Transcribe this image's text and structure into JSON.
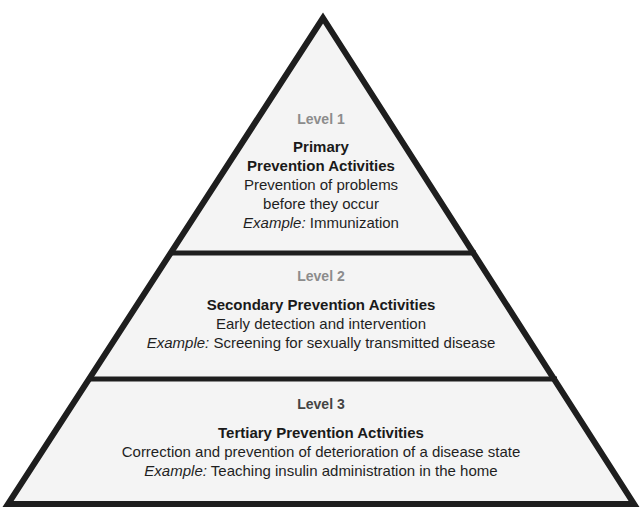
{
  "diagram": {
    "type": "pyramid",
    "colors": {
      "stroke": "#1e1e1e",
      "fill": "#f4f4f4",
      "level_label_light": "#8c8c8c",
      "level_label_dark": "#444444"
    },
    "tiers": [
      {
        "level": "Level 1",
        "title_lines": [
          "Primary",
          "Prevention Activities"
        ],
        "description_lines": [
          "Prevention of problems",
          "before they occur"
        ],
        "example_label": "Example:",
        "example_text": " Immunization"
      },
      {
        "level": "Level 2",
        "title_lines": [
          "Secondary Prevention Activities"
        ],
        "description_lines": [
          "Early detection and intervention"
        ],
        "example_label": "Example:",
        "example_text": " Screening for sexually transmitted disease"
      },
      {
        "level": "Level 3",
        "title_lines": [
          "Tertiary Prevention Activities"
        ],
        "description_lines": [
          "Correction and prevention of deterioration of a disease state"
        ],
        "example_label": "Example:",
        "example_text": " Teaching insulin administration in the home"
      }
    ]
  }
}
